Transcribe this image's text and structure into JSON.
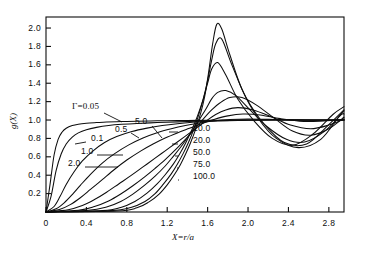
{
  "figure": {
    "background": "#ffffff",
    "ink": "#0d0d0d",
    "y_axis_title": "g(X)",
    "x_axis_title": "X=r/a",
    "gamma_symbol": "Γ",
    "gamma_prefix_label": "Γ=0.05"
  },
  "chart_data": {
    "type": "line",
    "title": "",
    "xlabel": "X=r/a",
    "ylabel": "g(X)",
    "xlim": [
      0,
      2.95
    ],
    "ylim": [
      0,
      2.12
    ],
    "grid": false,
    "legend": "inline-annotations",
    "xticks": [
      "0",
      "0.4",
      "0.8",
      "1.2",
      "1.6",
      "2.0",
      "2.4",
      "2.8"
    ],
    "xtick_values": [
      0,
      0.4,
      0.8,
      1.2,
      1.6,
      2.0,
      2.4,
      2.8
    ],
    "yticks": [
      "0.2",
      "0.4",
      "0.6",
      "0.8",
      "1.0",
      "1.2",
      "1.4",
      "1.6",
      "1.8",
      "2.0"
    ],
    "ytick_values": [
      0.2,
      0.4,
      0.6,
      0.8,
      1.0,
      1.2,
      1.4,
      1.6,
      1.8,
      2.0
    ],
    "series": [
      {
        "name": "0.05",
        "label": "Γ=0.05",
        "x": [
          0.0,
          0.04,
          0.08,
          0.12,
          0.16,
          0.2,
          0.26,
          0.32,
          0.4,
          0.5,
          0.6,
          0.75,
          0.9,
          1.1,
          1.3,
          1.5,
          1.7,
          1.9,
          2.1,
          2.3,
          2.5,
          2.7,
          2.95
        ],
        "y": [
          0.0,
          0.3,
          0.62,
          0.79,
          0.87,
          0.91,
          0.94,
          0.955,
          0.965,
          0.972,
          0.978,
          0.983,
          0.987,
          0.991,
          0.994,
          0.996,
          0.998,
          0.999,
          1.0,
          1.0,
          1.0,
          1.0,
          1.0
        ]
      },
      {
        "name": "0.1",
        "label": "0.1",
        "x": [
          0.0,
          0.05,
          0.1,
          0.15,
          0.2,
          0.26,
          0.32,
          0.4,
          0.5,
          0.62,
          0.75,
          0.9,
          1.1,
          1.3,
          1.5,
          1.7,
          1.9,
          2.1,
          2.3,
          2.5,
          2.7,
          2.95
        ],
        "y": [
          0.0,
          0.17,
          0.45,
          0.63,
          0.74,
          0.815,
          0.86,
          0.895,
          0.92,
          0.94,
          0.953,
          0.963,
          0.972,
          0.98,
          0.986,
          0.991,
          0.995,
          0.998,
          1.0,
          1.0,
          1.0,
          1.0
        ]
      },
      {
        "name": "0.5",
        "label": "0.5",
        "x": [
          0.0,
          0.08,
          0.14,
          0.2,
          0.28,
          0.36,
          0.46,
          0.58,
          0.7,
          0.85,
          1.0,
          1.15,
          1.3,
          1.45,
          1.6,
          1.75,
          1.95,
          2.15,
          2.4,
          2.65,
          2.95
        ],
        "y": [
          0.0,
          0.06,
          0.17,
          0.3,
          0.44,
          0.555,
          0.66,
          0.755,
          0.82,
          0.875,
          0.912,
          0.94,
          0.96,
          0.975,
          0.986,
          0.993,
          0.999,
          1.002,
          1.002,
          1.001,
          1.0
        ]
      },
      {
        "name": "1.0",
        "label": "1.0",
        "x": [
          0.0,
          0.1,
          0.18,
          0.26,
          0.34,
          0.44,
          0.56,
          0.68,
          0.82,
          0.96,
          1.1,
          1.24,
          1.38,
          1.52,
          1.66,
          1.82,
          2.0,
          2.2,
          2.45,
          2.7,
          2.95
        ],
        "y": [
          0.0,
          0.035,
          0.1,
          0.19,
          0.29,
          0.41,
          0.535,
          0.635,
          0.73,
          0.805,
          0.862,
          0.905,
          0.94,
          0.968,
          0.99,
          1.005,
          1.012,
          1.008,
          1.0,
          0.998,
          1.0
        ]
      },
      {
        "name": "2.0",
        "label": "2.0",
        "x": [
          0.0,
          0.14,
          0.24,
          0.34,
          0.44,
          0.56,
          0.68,
          0.8,
          0.94,
          1.06,
          1.18,
          1.3,
          1.42,
          1.54,
          1.66,
          1.8,
          1.95,
          2.12,
          2.32,
          2.55,
          2.75,
          2.95
        ],
        "y": [
          0.0,
          0.03,
          0.08,
          0.155,
          0.245,
          0.355,
          0.465,
          0.565,
          0.665,
          0.74,
          0.805,
          0.86,
          0.91,
          0.96,
          1.005,
          1.045,
          1.065,
          1.055,
          1.015,
          0.985,
          0.99,
          1.005
        ]
      },
      {
        "name": "5.0",
        "label": "5.0",
        "x": [
          0.0,
          0.22,
          0.36,
          0.48,
          0.6,
          0.72,
          0.84,
          0.96,
          1.08,
          1.18,
          1.28,
          1.38,
          1.48,
          1.58,
          1.68,
          1.78,
          1.9,
          2.05,
          2.22,
          2.42,
          2.62,
          2.8,
          2.95
        ],
        "y": [
          0.0,
          0.025,
          0.07,
          0.135,
          0.215,
          0.305,
          0.395,
          0.49,
          0.585,
          0.665,
          0.745,
          0.825,
          0.905,
          0.985,
          1.06,
          1.11,
          1.135,
          1.11,
          1.04,
          0.945,
          0.905,
          0.945,
          1.01
        ]
      },
      {
        "name": "10.0",
        "label": "10.0",
        "x": [
          0.0,
          0.32,
          0.48,
          0.62,
          0.74,
          0.86,
          0.98,
          1.08,
          1.18,
          1.28,
          1.38,
          1.48,
          1.56,
          1.64,
          1.72,
          1.82,
          1.94,
          2.08,
          2.26,
          2.44,
          2.62,
          2.8,
          2.95
        ],
        "y": [
          0.0,
          0.02,
          0.06,
          0.12,
          0.195,
          0.285,
          0.385,
          0.475,
          0.57,
          0.675,
          0.79,
          0.91,
          1.015,
          1.11,
          1.185,
          1.245,
          1.245,
          1.165,
          1.02,
          0.88,
          0.835,
          0.905,
          1.03
        ]
      },
      {
        "name": "20.0",
        "label": "20.0",
        "x": [
          0.0,
          0.42,
          0.6,
          0.74,
          0.86,
          0.98,
          1.08,
          1.18,
          1.26,
          1.34,
          1.42,
          1.5,
          1.58,
          1.64,
          1.7,
          1.78,
          1.88,
          2.02,
          2.18,
          2.38,
          2.56,
          2.76,
          2.92,
          2.95
        ],
        "y": [
          0.0,
          0.018,
          0.055,
          0.115,
          0.195,
          0.295,
          0.39,
          0.5,
          0.605,
          0.715,
          0.84,
          0.975,
          1.115,
          1.23,
          1.3,
          1.32,
          1.265,
          1.11,
          0.935,
          0.79,
          0.76,
          0.88,
          1.055,
          1.065
        ]
      },
      {
        "name": "50.0",
        "label": "50.0",
        "x": [
          0.0,
          0.56,
          0.74,
          0.88,
          1.0,
          1.1,
          1.18,
          1.26,
          1.32,
          1.38,
          1.44,
          1.5,
          1.55,
          1.6,
          1.64,
          1.7,
          1.78,
          1.9,
          2.06,
          2.24,
          2.44,
          2.64,
          2.84,
          2.95
        ],
        "y": [
          0.0,
          0.015,
          0.05,
          0.115,
          0.205,
          0.305,
          0.405,
          0.52,
          0.625,
          0.745,
          0.885,
          1.045,
          1.205,
          1.4,
          1.555,
          1.625,
          1.49,
          1.225,
          0.99,
          0.8,
          0.725,
          0.845,
          1.06,
          1.145
        ]
      },
      {
        "name": "75.0",
        "label": "75.0",
        "x": [
          0.0,
          0.64,
          0.84,
          0.98,
          1.08,
          1.16,
          1.24,
          1.3,
          1.36,
          1.41,
          1.46,
          1.51,
          1.56,
          1.6,
          1.64,
          1.68,
          1.74,
          1.84,
          1.98,
          2.16,
          2.36,
          2.58,
          2.8,
          2.95
        ],
        "y": [
          0.0,
          0.015,
          0.05,
          0.115,
          0.2,
          0.3,
          0.415,
          0.52,
          0.64,
          0.755,
          0.89,
          1.05,
          1.24,
          1.43,
          1.65,
          1.83,
          1.88,
          1.6,
          1.245,
          0.955,
          0.755,
          0.74,
          0.95,
          1.11
        ]
      },
      {
        "name": "100.0",
        "label": "100.0",
        "x": [
          0.0,
          0.7,
          0.9,
          1.02,
          1.12,
          1.2,
          1.27,
          1.33,
          1.38,
          1.43,
          1.48,
          1.53,
          1.57,
          1.61,
          1.65,
          1.69,
          1.74,
          1.82,
          1.94,
          2.1,
          2.28,
          2.5,
          2.72,
          2.9,
          2.95
        ],
        "y": [
          0.0,
          0.012,
          0.045,
          0.11,
          0.195,
          0.295,
          0.405,
          0.515,
          0.625,
          0.75,
          0.895,
          1.07,
          1.25,
          1.52,
          1.83,
          2.04,
          1.99,
          1.71,
          1.335,
          1.02,
          0.8,
          0.7,
          0.79,
          1.04,
          1.1
        ]
      }
    ],
    "annotations": [
      {
        "name": "gamma-0-05",
        "text": "Γ=0.05",
        "x_px": 72,
        "y_px": 107,
        "leader": [
          [
            104,
            113
          ],
          [
            122,
            122
          ]
        ]
      },
      {
        "name": "gamma-0-1",
        "text": "0.1",
        "x_px": 91,
        "y_px": 139,
        "leader": [
          [
            86,
            142
          ],
          [
            75,
            144
          ]
        ]
      },
      {
        "name": "gamma-0-5",
        "text": "0.5",
        "x_px": 115,
        "y_px": 130,
        "leader": [
          [
            131,
            133
          ],
          [
            139,
            138
          ]
        ]
      },
      {
        "name": "gamma-1-0",
        "text": "1.0",
        "x_px": 81,
        "y_px": 152,
        "leader": [
          [
            97,
            155
          ],
          [
            123,
            155
          ]
        ]
      },
      {
        "name": "gamma-2-0",
        "text": "2.0",
        "x_px": 68,
        "y_px": 164,
        "leader": [
          [
            85,
            167
          ],
          [
            118,
            167
          ]
        ]
      },
      {
        "name": "gamma-5-0",
        "text": "5.0",
        "x_px": 135,
        "y_px": 122,
        "leader": [
          [
            152,
            126
          ],
          [
            162,
            138
          ]
        ]
      },
      {
        "name": "gamma-10-0",
        "text": "10.0",
        "x_px": 193,
        "y_px": 129,
        "leader": [
          [
            178,
            132
          ],
          [
            169,
            132
          ]
        ]
      },
      {
        "name": "gamma-20-0",
        "text": "20.0",
        "x_px": 193,
        "y_px": 141,
        "leader": [
          [
            178,
            144
          ],
          [
            172,
            144
          ]
        ]
      },
      {
        "name": "gamma-50-0",
        "text": "50.0",
        "x_px": 193,
        "y_px": 153,
        "leader": [
          [
            178,
            156
          ],
          [
            175,
            156
          ]
        ]
      },
      {
        "name": "gamma-75-0",
        "text": "75.0",
        "x_px": 193,
        "y_px": 165,
        "leader": [
          [
            178,
            168
          ],
          [
            177,
            168
          ]
        ]
      },
      {
        "name": "gamma-100-0",
        "text": "100.0",
        "x_px": 193,
        "y_px": 177,
        "leader": [
          [
            178,
            180
          ],
          [
            179,
            180
          ]
        ]
      }
    ]
  }
}
